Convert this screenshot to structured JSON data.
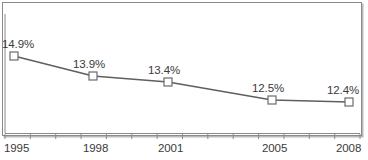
{
  "chart_data": {
    "type": "line",
    "title": "",
    "xlabel": "",
    "ylabel": "",
    "grid": false,
    "legend": "none",
    "categories": [
      "1995",
      "1998",
      "2001",
      "2005",
      "2008"
    ],
    "x": [
      1995,
      1998,
      2001,
      2005,
      2008
    ],
    "values": [
      14.9,
      13.9,
      13.4,
      12.5,
      12.4
    ],
    "data_labels": [
      "14.9%",
      "13.9%",
      "13.4%",
      "12.5%",
      "12.4%"
    ],
    "xlim": [
      1995,
      2008
    ],
    "ylim": [
      12.0,
      15.2
    ],
    "x_tick_labels": [
      "1995",
      "1998",
      "2001",
      "2005",
      "2008"
    ],
    "x_minor_tick_count": 14,
    "marker": "square",
    "marker_fill": "#ffffff",
    "marker_stroke": "#6b6b6b",
    "line_color": "#5f5f5f",
    "axis_color": "#8a8a8a",
    "text_color": "#3a3a3a",
    "border_color": "#8a8a8a"
  },
  "points": [
    {
      "label": "14.9%",
      "year": "1995",
      "px": 14,
      "py": 56,
      "lx": 2,
      "ly": 38
    },
    {
      "label": "13.9%",
      "year": "1998",
      "px": 93,
      "py": 76,
      "lx": 73,
      "ly": 58
    },
    {
      "label": "13.4%",
      "year": "2001",
      "px": 168,
      "py": 82,
      "lx": 148,
      "ly": 64
    },
    {
      "label": "12.5%",
      "year": "2005",
      "px": 272,
      "py": 100,
      "lx": 252,
      "ly": 82
    },
    {
      "label": "12.4%",
      "year": "2008",
      "px": 349,
      "py": 102,
      "lx": 327,
      "ly": 84
    }
  ],
  "x_axis_labels": [
    {
      "text": "1995",
      "x": 4
    },
    {
      "text": "1998",
      "x": 83
    },
    {
      "text": "2001",
      "x": 158
    },
    {
      "text": "2005",
      "x": 262
    },
    {
      "text": "2008",
      "x": 336
    }
  ]
}
